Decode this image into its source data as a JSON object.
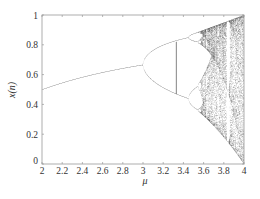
{
  "chart_data": {
    "type": "scatter",
    "title": "",
    "xlabel": "μ",
    "ylabel": "x(n)",
    "xlim": [
      2,
      4
    ],
    "ylim": [
      0,
      1
    ],
    "grid": false,
    "legend": null,
    "x_ticks": [
      "2",
      "2.2",
      "2.4",
      "2.6",
      "2.8",
      "3",
      "3.2",
      "3.4",
      "3.6",
      "3.8",
      "4"
    ],
    "y_ticks": [
      "0",
      "0.2",
      "0.4",
      "0.6",
      "0.8",
      "1"
    ],
    "series": [
      {
        "name": "logistic map bifurcation",
        "equation": "x(n+1) = μ·x(n)·(1 − x(n))",
        "description": "Stable fixed point rising from 0.5 at μ=2 to ~0.667 at μ=3, period-doubling bifurcation at μ=3 (branches ~0.84 and ~0.44 at μ=3.45), cascade into chaos beyond μ≈3.57, chaotic band spanning ~0 to 1 at μ=4",
        "key_points": [
          {
            "mu": 2.0,
            "x": [
              0.5
            ]
          },
          {
            "mu": 2.5,
            "x": [
              0.6
            ]
          },
          {
            "mu": 3.0,
            "x": [
              0.667
            ]
          },
          {
            "mu": 3.2,
            "x": [
              0.513,
              0.799
            ]
          },
          {
            "mu": 3.45,
            "x": [
              0.44,
              0.85
            ]
          },
          {
            "mu": 3.5,
            "x": [
              0.383,
              0.501,
              0.827,
              0.875
            ]
          },
          {
            "mu": 3.57,
            "x_range": [
              0.33,
              0.89
            ]
          },
          {
            "mu": 4.0,
            "x_range": [
              0.0,
              1.0
            ]
          }
        ],
        "color": "#333333"
      }
    ],
    "annotations": [
      {
        "type": "vertical-line",
        "mu": 3.33,
        "x_range": [
          0.47,
          0.82
        ]
      }
    ]
  }
}
